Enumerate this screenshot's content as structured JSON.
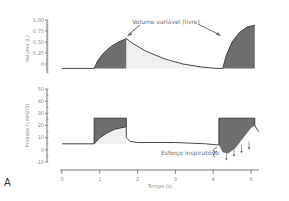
{
  "figure": {
    "panel_label": "A",
    "xlabel": "Tempo (s)"
  },
  "chart_data": [
    {
      "type": "area",
      "panel": "top",
      "title": "",
      "ylabel": "Volume (L)",
      "xlabel": "",
      "ylim": [
        -0.2,
        1.0
      ],
      "xlim": [
        0,
        5.2
      ],
      "yticks": [
        0,
        0.25,
        0.5,
        0.75,
        1.0
      ],
      "ytick_labels": [
        "0",
        "0,25",
        "0,50",
        "0,75",
        "1,00"
      ],
      "annotation": "Volume variável (livre)",
      "series": [
        {
          "name": "Volume",
          "points": [
            [
              0.0,
              -0.1
            ],
            [
              0.85,
              -0.1
            ],
            [
              0.95,
              0.08
            ],
            [
              1.1,
              0.25
            ],
            [
              1.3,
              0.4
            ],
            [
              1.5,
              0.5
            ],
            [
              1.7,
              0.58
            ],
            [
              1.85,
              0.48
            ],
            [
              2.2,
              0.3
            ],
            [
              2.7,
              0.12
            ],
            [
              3.2,
              0.0
            ],
            [
              3.7,
              -0.07
            ],
            [
              4.1,
              -0.1
            ],
            [
              4.25,
              -0.1
            ],
            [
              4.35,
              0.2
            ],
            [
              4.5,
              0.5
            ],
            [
              4.7,
              0.72
            ],
            [
              4.9,
              0.84
            ],
            [
              5.1,
              0.88
            ]
          ]
        }
      ],
      "shaded_regions": [
        {
          "name": "inspiração 1",
          "x": [
            0.85,
            1.7
          ]
        },
        {
          "name": "inspiração 2",
          "x": [
            4.25,
            5.1
          ]
        }
      ]
    },
    {
      "type": "area",
      "panel": "bottom",
      "title": "",
      "ylabel": "Pressão (cmH2O)",
      "xlabel": "Tempo (s)",
      "ylim": [
        -10,
        50
      ],
      "xlim": [
        0,
        5.2
      ],
      "yticks": [
        -10,
        0,
        10,
        20,
        30,
        40,
        50
      ],
      "ytick_labels": [
        "-10",
        "0",
        "10",
        "20",
        "30",
        "40",
        "50"
      ],
      "xticks": [
        0,
        1,
        2,
        3,
        4,
        5
      ],
      "xtick_labels": [
        "0",
        "1",
        "2",
        "3",
        "4",
        "5"
      ],
      "annotation": "Esforço inspiratório",
      "series": [
        {
          "name": "Pressão aplicada",
          "points": [
            [
              0.0,
              5
            ],
            [
              0.85,
              5
            ],
            [
              0.85,
              26
            ],
            [
              1.7,
              26
            ],
            [
              1.7,
              10
            ],
            [
              1.8,
              7
            ],
            [
              2.0,
              6
            ],
            [
              3.0,
              6
            ],
            [
              3.8,
              5
            ],
            [
              4.15,
              4
            ],
            [
              4.15,
              26
            ],
            [
              5.1,
              26
            ],
            [
              5.1,
              20
            ],
            [
              5.2,
              15
            ]
          ]
        },
        {
          "name": "Pressão alveolar",
          "points": [
            [
              0.85,
              5
            ],
            [
              1.0,
              10
            ],
            [
              1.2,
              14
            ],
            [
              1.4,
              17
            ],
            [
              1.7,
              19
            ],
            [
              4.15,
              4
            ],
            [
              4.25,
              -2
            ],
            [
              4.4,
              -3
            ],
            [
              4.6,
              2
            ],
            [
              4.8,
              10
            ],
            [
              5.0,
              18
            ],
            [
              5.1,
              20
            ]
          ]
        }
      ],
      "shaded_regions": [
        {
          "name": "pressão 1",
          "x": [
            0.85,
            1.7
          ]
        },
        {
          "name": "pressão 2",
          "x": [
            4.15,
            5.1
          ]
        }
      ],
      "effort_arrows_x": [
        4.35,
        4.55,
        4.75,
        4.95
      ]
    }
  ]
}
